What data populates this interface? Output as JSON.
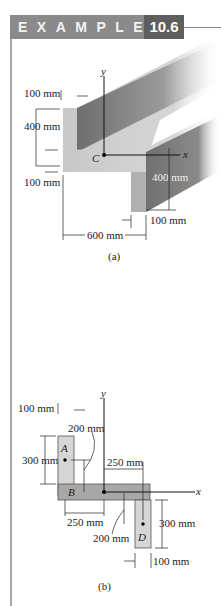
{
  "header": {
    "label": "EXAMPLE",
    "number": "10.6"
  },
  "figure_a": {
    "caption": "(a)",
    "axis_y": "y",
    "axis_x": "x",
    "centroid": "C",
    "dims": {
      "flange_thickness_top": "100 mm",
      "web_height": "400 mm",
      "flange_thickness_bottom": "100 mm",
      "right_leg_height": "400 mm",
      "right_leg_thickness": "100 mm",
      "overall_width": "600 mm"
    }
  },
  "figure_b": {
    "caption": "(b)",
    "axis_y": "y",
    "axis_x": "x",
    "parts": [
      "A",
      "B",
      "D"
    ],
    "dims": {
      "left_width": "100 mm",
      "a_offset": "200 mm",
      "left_height": "300 mm",
      "right_offset": "250 mm",
      "left_offset": "250 mm",
      "d_offset": "200 mm",
      "right_height": "300 mm",
      "right_width": "100 mm"
    }
  }
}
